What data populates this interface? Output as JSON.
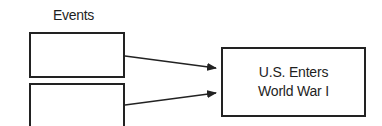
{
  "diagram": {
    "type": "cause-effect",
    "column_label": "Events",
    "cause_boxes": [
      {
        "id": "event-1",
        "text": ""
      },
      {
        "id": "event-2",
        "text": ""
      }
    ],
    "effect_box": {
      "line1": "U.S. Enters",
      "line2": "World War I"
    },
    "edges": [
      {
        "from": "event-1",
        "to": "effect"
      },
      {
        "from": "event-2",
        "to": "effect"
      }
    ],
    "colors": {
      "stroke": "#222222",
      "background": "#ffffff",
      "text": "#1e1e1e"
    }
  }
}
